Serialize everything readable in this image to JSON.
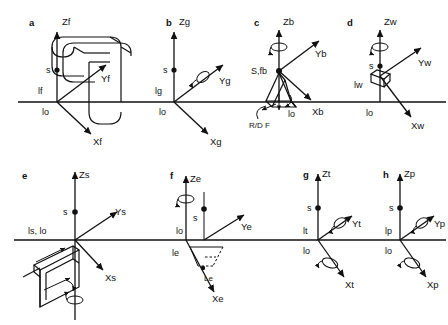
{
  "figure": {
    "type": "technical-diagram",
    "rows": 2,
    "columns": 4,
    "common": {
      "vertical_axis_name": "Z",
      "up_right_axis_name": "Y",
      "down_right_axis_name": "X",
      "point_marker_label": "s",
      "ground_origin_label": "lo"
    },
    "panels": [
      {
        "id": "a",
        "letter": "a",
        "z_label": "Zf",
        "y_label": "Yf",
        "x_label": "Xf",
        "s_label": "s",
        "offset_label": "lf",
        "origin_label": "lo",
        "has_rotation_arrow": false,
        "shape": "rounded-tube-fork"
      },
      {
        "id": "b",
        "letter": "b",
        "z_label": "Zg",
        "y_label": "Yg",
        "x_label": "Xg",
        "s_label": "s",
        "offset_label": "lg",
        "origin_label": "lo",
        "has_rotation_arrow": true,
        "rotation_axis": "Y",
        "shape": "none"
      },
      {
        "id": "c",
        "letter": "c",
        "z_label": "Zb",
        "y_label": "Yb",
        "x_label": "Xb",
        "s_label": "S,fb",
        "origin_label": "lo",
        "extra_label": "R/D F",
        "has_rotation_arrow": true,
        "rotation_axis": "Z",
        "shape": "wedge-brake"
      },
      {
        "id": "d",
        "letter": "d",
        "z_label": "Zw",
        "y_label": "Yw",
        "x_label": "Xw",
        "s_label": "s",
        "offset_label": "lw",
        "origin_label": "lo",
        "has_rotation_arrow": true,
        "rotation_axis": "Z",
        "shape": "small-box"
      },
      {
        "id": "e",
        "letter": "e",
        "z_label": "Zs",
        "y_label": "Ys",
        "x_label": "Xs",
        "s_label": "s",
        "origin_label": "ls, lo",
        "has_rotation_arrow": true,
        "rotation_axis": "Z-lower",
        "shape": "block-wedge"
      },
      {
        "id": "f",
        "letter": "f",
        "z_label": "Ze",
        "y_label": "Ye",
        "x_label": "Xe",
        "s_label": "s",
        "origin_label": "lo",
        "offset_label": "le",
        "extra_label": "Le",
        "has_rotation_arrow": true,
        "rotation_axis": "Z",
        "shape": "dashed-parallelogram"
      },
      {
        "id": "g",
        "letter": "g",
        "z_label": "Zt",
        "y_label": "Yt",
        "x_label": "Xt",
        "s_label": "s",
        "offset_label": "lt",
        "origin_label": "lo",
        "has_rotation_arrow": true,
        "rotation_axis": "XY",
        "shape": "none"
      },
      {
        "id": "h",
        "letter": "h",
        "z_label": "Zp",
        "y_label": "Yp",
        "x_label": "Xp",
        "s_label": "s",
        "offset_label": "lp",
        "origin_label": "lo",
        "has_rotation_arrow": true,
        "rotation_axis": "XY",
        "shape": "none"
      }
    ]
  },
  "colors": {
    "stroke": "#111111",
    "background": "#ffffff"
  }
}
